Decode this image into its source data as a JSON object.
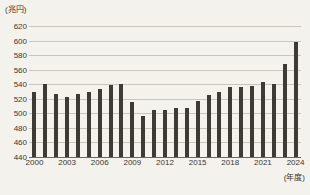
{
  "chart_data": {
    "type": "bar",
    "title": "",
    "subtitle": "",
    "unit_label": "(兆円)",
    "xlabel": "(年度)",
    "ylabel": "",
    "ylim": [
      440,
      620
    ],
    "ytick_values": [
      440,
      460,
      480,
      500,
      520,
      540,
      560,
      580,
      600,
      620
    ],
    "ytick_labels": [
      "440",
      "460",
      "480",
      "500",
      "520",
      "540",
      "560",
      "580",
      "600",
      "620"
    ],
    "grid": true,
    "legend": "none",
    "bar_color": "#3e3a35",
    "background_color": "#f4f2ec",
    "categories": [
      "2000",
      "2001",
      "2002",
      "2003",
      "2004",
      "2005",
      "2006",
      "2007",
      "2008",
      "2009",
      "2010",
      "2011",
      "2012",
      "2013",
      "2014",
      "2015",
      "2016",
      "2017",
      "2018",
      "2019",
      "2020",
      "2021",
      "2022",
      "2023",
      "2024"
    ],
    "xtick_labels": [
      "2000",
      "2003",
      "2006",
      "2009",
      "2012",
      "2015",
      "2018",
      "2021",
      "2024"
    ],
    "values": [
      529,
      541,
      526,
      523,
      526,
      529,
      533,
      539,
      540,
      515,
      496,
      504,
      504,
      508,
      508,
      517,
      525,
      530,
      536,
      536,
      538,
      543,
      541,
      568,
      598
    ]
  }
}
